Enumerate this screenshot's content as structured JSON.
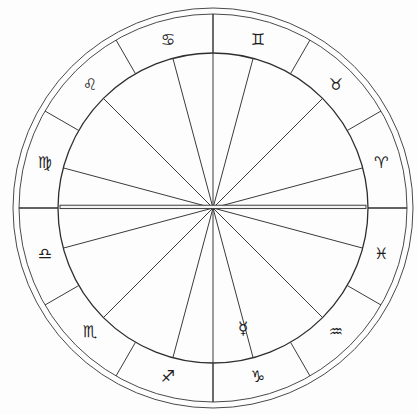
{
  "chart": {
    "type": "zodiac-wheel",
    "center": {
      "x": 213,
      "y": 208
    },
    "radii": {
      "outer_rim_outer": 200,
      "outer_rim_inner": 194,
      "zodiac_ring_inner": 155,
      "glyph_ring": 174
    },
    "style": {
      "background": "#fdfdfd",
      "line_color": "#3a3a3a",
      "glyph_color": "#1c1c1c"
    },
    "spoke_count": 12,
    "cusp_offset_degrees": 15
  },
  "zodiac_signs": [
    {
      "name": "Capricorn",
      "glyph": "♑",
      "angle_deg": 285,
      "label": "Capricorn"
    },
    {
      "name": "Sagittarius",
      "glyph": "♐",
      "angle_deg": 255,
      "label": "Sagittarius"
    },
    {
      "name": "Scorpio",
      "glyph": "♏",
      "angle_deg": 225,
      "label": "Scorpio"
    },
    {
      "name": "Libra",
      "glyph": "♎",
      "angle_deg": 195,
      "label": "Libra"
    },
    {
      "name": "Virgo",
      "glyph": "♍",
      "angle_deg": 165,
      "label": "Virgo"
    },
    {
      "name": "Leo",
      "glyph": "♌",
      "angle_deg": 135,
      "label": "Leo"
    },
    {
      "name": "Cancer",
      "glyph": "♋",
      "angle_deg": 105,
      "label": "Cancer"
    },
    {
      "name": "Gemini",
      "glyph": "♊",
      "angle_deg": 75,
      "label": "Gemini"
    },
    {
      "name": "Taurus",
      "glyph": "♉",
      "angle_deg": 45,
      "label": "Taurus"
    },
    {
      "name": "Aries",
      "glyph": "♈",
      "angle_deg": 15,
      "label": "Aries"
    },
    {
      "name": "Pisces",
      "glyph": "♓",
      "angle_deg": 345,
      "label": "Pisces"
    },
    {
      "name": "Aquarius",
      "glyph": "♒",
      "angle_deg": 315,
      "label": "Aquarius"
    }
  ],
  "planets": [
    {
      "name": "Mercury",
      "glyph": "☿",
      "x": 243,
      "y": 328,
      "label": "Mercury"
    }
  ],
  "axes": [
    {
      "name": "ascendant-descendant",
      "label": "Ascendant / Descendant",
      "angle_deg": 0,
      "emphasis": "thick"
    }
  ],
  "chart_data": {
    "type": "pie",
    "categories": [
      "Capricorn",
      "Sagittarius",
      "Scorpio",
      "Libra",
      "Virgo",
      "Leo",
      "Cancer",
      "Gemini",
      "Taurus",
      "Aries",
      "Pisces",
      "Aquarius"
    ],
    "values": [
      30,
      30,
      30,
      30,
      30,
      30,
      30,
      30,
      30,
      30,
      30,
      30
    ],
    "unit": "degrees",
    "legend": "none",
    "grid": false,
    "xlabel": "",
    "ylabel": "",
    "annotations": [
      "Mercury glyph placed inside inner circle near lower center",
      "Horizontal Ascendant-Descendant axis drawn as a doubled thick line"
    ]
  }
}
